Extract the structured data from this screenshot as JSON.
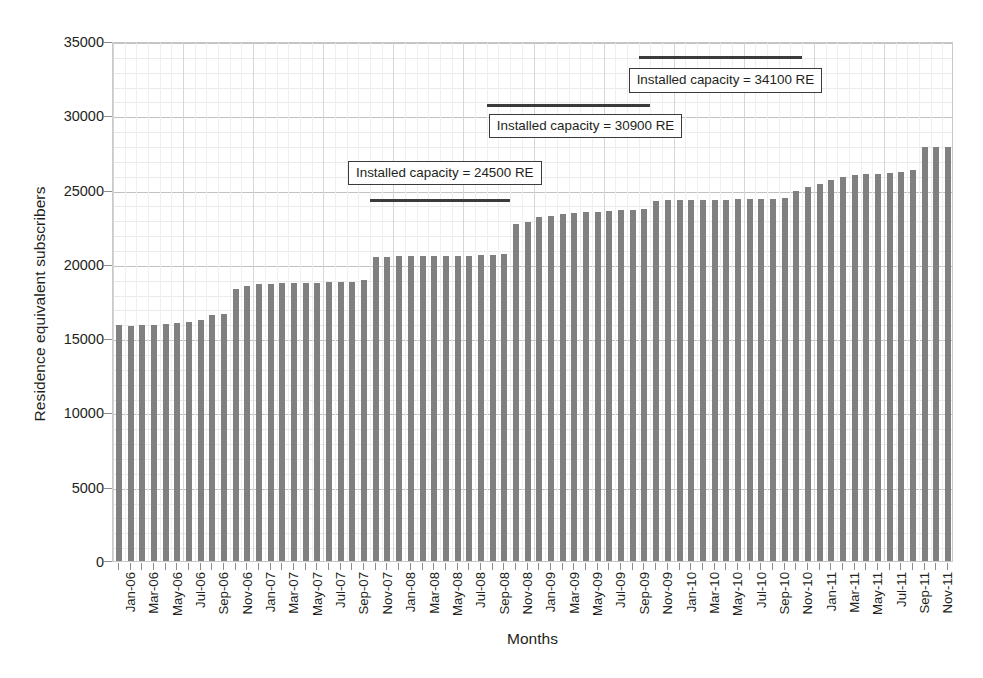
{
  "chart_data": {
    "type": "bar",
    "title": "",
    "xlabel": "Months",
    "ylabel": "Residence equivalent subscribers",
    "ylim": [
      0,
      35000
    ],
    "ytick_values": [
      0,
      5000,
      10000,
      15000,
      20000,
      25000,
      30000,
      35000
    ],
    "ytick_labels": [
      "0",
      "5000",
      "10000",
      "15000",
      "20000",
      "25000",
      "30000",
      "35000"
    ],
    "grid": true,
    "legend": "none",
    "bar_color": "#808080",
    "categories": [
      "Jan-06",
      "Feb-06",
      "Mar-06",
      "Apr-06",
      "May-06",
      "Jun-06",
      "Jul-06",
      "Aug-06",
      "Sep-06",
      "Oct-06",
      "Nov-06",
      "Dec-06",
      "Jan-07",
      "Feb-07",
      "Mar-07",
      "Apr-07",
      "May-07",
      "Jun-07",
      "Jul-07",
      "Aug-07",
      "Sep-07",
      "Oct-07",
      "Nov-07",
      "Dec-07",
      "Jan-08",
      "Feb-08",
      "Mar-08",
      "Apr-08",
      "May-08",
      "Jun-08",
      "Jul-08",
      "Aug-08",
      "Sep-08",
      "Oct-08",
      "Nov-08",
      "Dec-08",
      "Jan-09",
      "Feb-09",
      "Mar-09",
      "Apr-09",
      "May-09",
      "Jun-09",
      "Jul-09",
      "Aug-09",
      "Sep-09",
      "Oct-09",
      "Nov-09",
      "Dec-09",
      "Jan-10",
      "Feb-10",
      "Mar-10",
      "Apr-10",
      "May-10",
      "Jun-10",
      "Jul-10",
      "Aug-10",
      "Sep-10",
      "Oct-10",
      "Nov-10",
      "Dec-10",
      "Jan-11",
      "Feb-11",
      "Mar-11",
      "Apr-11",
      "May-11",
      "Jun-11",
      "Jul-11",
      "Aug-11",
      "Sep-11",
      "Oct-11",
      "Nov-11",
      "Dec-11"
    ],
    "xtick_labels_shown": [
      "Jan-06",
      "Mar-06",
      "May-06",
      "Jul-06",
      "Sep-06",
      "Nov-06",
      "Jan-07",
      "Mar-07",
      "May-07",
      "Jul-07",
      "Sep-07",
      "Nov-07",
      "Jan-08",
      "Mar-08",
      "May-08",
      "Jul-08",
      "Sep-08",
      "Nov-08",
      "Jan-09",
      "Mar-09",
      "May-09",
      "Jul-09",
      "Sep-09",
      "Nov-09",
      "Jan-10",
      "Mar-10",
      "May-10",
      "Jul-10",
      "Sep-10",
      "Nov-10",
      "Jan-11",
      "Mar-11",
      "May-11",
      "Jul-11",
      "Sep-11",
      "Nov-11"
    ],
    "values": [
      15900,
      15850,
      15900,
      15900,
      15950,
      16050,
      16100,
      16250,
      16550,
      16650,
      18300,
      18500,
      18650,
      18650,
      18700,
      18700,
      18700,
      18700,
      18750,
      18750,
      18800,
      18900,
      20450,
      20450,
      20500,
      20500,
      20500,
      20550,
      20550,
      20550,
      20550,
      20600,
      20600,
      20650,
      22700,
      22800,
      23150,
      23200,
      23350,
      23400,
      23500,
      23500,
      23550,
      23600,
      23650,
      23700,
      24250,
      24300,
      24300,
      24300,
      24300,
      24300,
      24300,
      24350,
      24350,
      24350,
      24400,
      24450,
      24900,
      25150,
      25400,
      25650,
      25850,
      26000,
      26050,
      26050,
      26100,
      26200,
      26350,
      27850,
      27900,
      27900
    ],
    "annotations": [
      {
        "label": "Installed capacity = 24500 RE",
        "value": 24500,
        "line_start_category": "Nov-07",
        "line_end_category": "Oct-08"
      },
      {
        "label": "Installed capacity = 30900 RE",
        "value": 30900,
        "line_start_category": "Sep-08",
        "line_end_category": "Oct-09"
      },
      {
        "label": "Installed capacity = 34100 RE",
        "value": 34100,
        "line_start_category": "Oct-09",
        "line_end_category": "Nov-10"
      }
    ]
  }
}
